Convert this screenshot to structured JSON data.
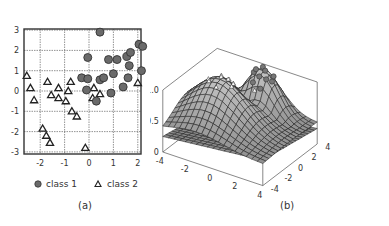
{
  "figure": {
    "panel_a": {
      "caption": "(a)",
      "legend": [
        {
          "marker": "circle",
          "label": "class 1"
        },
        {
          "marker": "triangle",
          "label": "class 2"
        }
      ]
    },
    "panel_b": {
      "caption": "(b)"
    }
  },
  "chart_data": [
    {
      "type": "scatter",
      "title": "",
      "xlabel": "",
      "ylabel": "",
      "xlim": [
        -2.6,
        2.15
      ],
      "ylim": [
        -3.05,
        3.05
      ],
      "xticks": [
        "-2",
        "-1",
        "0",
        "1",
        "2"
      ],
      "yticks": [
        "3",
        "2",
        "1",
        "0",
        "-1",
        "-2",
        "-3"
      ],
      "grid": true,
      "legend_position": "bottom",
      "colors": {
        "class1_fill": "#6a6a6a",
        "class1_stroke": "#333333",
        "class2_stroke": "#222222",
        "grid": "#666666"
      },
      "series": [
        {
          "name": "class 1",
          "marker": "circle",
          "points": [
            [
              0.45,
              2.9
            ],
            [
              2.05,
              2.3
            ],
            [
              2.2,
              2.2
            ],
            [
              -0.05,
              1.65
            ],
            [
              0.8,
              1.55
            ],
            [
              1.15,
              1.55
            ],
            [
              1.55,
              1.7
            ],
            [
              1.7,
              1.9
            ],
            [
              1.65,
              1.25
            ],
            [
              2.15,
              1.0
            ],
            [
              1.0,
              0.85
            ],
            [
              -0.3,
              0.65
            ],
            [
              -0.05,
              0.6
            ],
            [
              0.45,
              0.55
            ],
            [
              0.6,
              0.65
            ],
            [
              1.6,
              0.65
            ],
            [
              1.4,
              0.2
            ],
            [
              -0.1,
              0.05
            ],
            [
              0.9,
              -0.1
            ],
            [
              0.3,
              -0.5
            ]
          ]
        },
        {
          "name": "class 2",
          "marker": "triangle",
          "points": [
            [
              -2.55,
              0.75
            ],
            [
              -2.4,
              0.15
            ],
            [
              -2.25,
              -0.45
            ],
            [
              -1.7,
              0.45
            ],
            [
              -1.55,
              -0.2
            ],
            [
              -1.25,
              0.15
            ],
            [
              -1.25,
              -0.35
            ],
            [
              -0.85,
              0.0
            ],
            [
              -0.95,
              -0.5
            ],
            [
              -0.75,
              0.45
            ],
            [
              -0.7,
              -1.0
            ],
            [
              -0.5,
              -1.25
            ],
            [
              0.2,
              0.15
            ],
            [
              0.15,
              -0.35
            ],
            [
              0.45,
              -0.15
            ],
            [
              2.0,
              0.4
            ],
            [
              -1.9,
              -1.85
            ],
            [
              -1.75,
              -2.2
            ],
            [
              -1.6,
              -2.55
            ],
            [
              -0.15,
              -2.8
            ]
          ]
        }
      ]
    },
    {
      "type": "surface3d",
      "title": "",
      "x_ticks": [
        "-4",
        "-2",
        "0",
        "2",
        "4"
      ],
      "y_ticks": [
        "-4",
        "-2",
        "0",
        "2",
        "4"
      ],
      "z_ticks": [
        "0",
        "0.5",
        "1.0"
      ],
      "zlim": [
        0,
        1.0
      ],
      "surfaces": [
        {
          "name": "upper decision surface",
          "shape": "two humps with a saddle",
          "color": "#8c8c8c"
        },
        {
          "name": "lower plane",
          "shape": "slightly tilted plane near z=0.3",
          "color": "#9a9a9a"
        }
      ],
      "markers": [
        {
          "name": "class 1",
          "marker": "circle",
          "location": "on right hump"
        },
        {
          "name": "class 2",
          "marker": "triangle",
          "location": "on left hump"
        }
      ]
    }
  ]
}
